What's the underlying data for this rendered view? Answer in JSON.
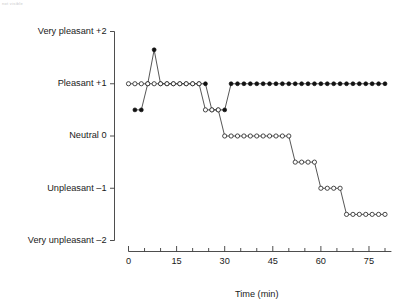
{
  "figure": {
    "artifact_text": "not visible",
    "background": "#ffffff",
    "ink_color": "#1a1a1a"
  },
  "chart_data": {
    "type": "line",
    "title": "",
    "subtitle": "",
    "xlabel": "Time (min)",
    "ylabel": "",
    "xlim": [
      0,
      82
    ],
    "ylim": [
      -2,
      2
    ],
    "grid": false,
    "legend_position": "none",
    "x_ticks_major": [
      0,
      15,
      30,
      45,
      60,
      75
    ],
    "x_tick_labels": [
      "0",
      "15",
      "30",
      "45",
      "60",
      "75"
    ],
    "x_tick_minor_step": 5,
    "y_ticks": [
      2,
      1,
      0,
      -1,
      -2
    ],
    "y_tick_labels": [
      "Very pleasant  +2",
      "Pleasant  +1",
      "Neutral  0",
      "Unpleasant  –1",
      "Very unpleasant  –2"
    ],
    "series": [
      {
        "name": "filled-circle-series",
        "marker": "filled-circle",
        "color": "#111111",
        "x": [
          2,
          4,
          6,
          8,
          10,
          12,
          14,
          16,
          18,
          20,
          22,
          24,
          26,
          28,
          30,
          32,
          34,
          36,
          38,
          40,
          42,
          44,
          46,
          48,
          50,
          52,
          54,
          56,
          58,
          60,
          62,
          64,
          66,
          68,
          70,
          72,
          74,
          76,
          78,
          80
        ],
        "values": [
          0.5,
          0.5,
          1,
          1.65,
          1,
          1,
          1,
          1,
          1,
          1,
          1,
          1,
          0.5,
          0.5,
          0.5,
          1,
          1,
          1,
          1,
          1,
          1,
          1,
          1,
          1,
          1,
          1,
          1,
          1,
          1,
          1,
          1,
          1,
          1,
          1,
          1,
          1,
          1,
          1,
          1,
          1
        ]
      },
      {
        "name": "open-circle-series",
        "marker": "open-circle",
        "color": "#2b2b2b",
        "x": [
          0,
          2,
          4,
          6,
          8,
          10,
          12,
          14,
          16,
          18,
          20,
          22,
          24,
          26,
          28,
          30,
          32,
          34,
          36,
          38,
          40,
          42,
          44,
          46,
          48,
          50,
          52,
          54,
          56,
          58,
          60,
          62,
          64,
          66,
          68,
          70,
          72,
          74,
          76,
          78,
          80
        ],
        "values": [
          1,
          1,
          1,
          1,
          1,
          1,
          1,
          1,
          1,
          1,
          1,
          1,
          0.5,
          0.5,
          0.5,
          0,
          0,
          0,
          0,
          0,
          0,
          0,
          0,
          0,
          0,
          0,
          -0.5,
          -0.5,
          -0.5,
          -0.5,
          -1,
          -1,
          -1,
          -1,
          -1.5,
          -1.5,
          -1.5,
          -1.5,
          -1.5,
          -1.5,
          -1.5
        ]
      }
    ]
  }
}
